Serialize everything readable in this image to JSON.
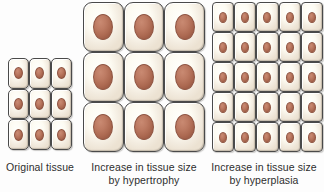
{
  "figure": {
    "background_color": "#fdfdfd",
    "cell_fill_color": "#fdfbf2",
    "cell_border_color": "#4a4a4a",
    "nucleus_color": "#bd7b63",
    "caption_text_color": "#2e2e2e"
  },
  "panels": [
    {
      "id": "original-tissue",
      "caption_lines": [
        "Original tissue"
      ],
      "grid": {
        "rows": 3,
        "columns": 3,
        "cell_count": 9
      },
      "cell_size": "small"
    },
    {
      "id": "hypertrophy",
      "caption_lines": [
        "Increase in tissue size",
        "by hypertrophy"
      ],
      "grid": {
        "rows": 3,
        "columns": 3,
        "cell_count": 9
      },
      "cell_size": "large"
    },
    {
      "id": "hyperplasia",
      "caption_lines": [
        "Increase in tissue size",
        "by hyperplasia"
      ],
      "grid": {
        "rows": 5,
        "columns": 5,
        "cell_count": 25
      },
      "cell_size": "small"
    }
  ]
}
